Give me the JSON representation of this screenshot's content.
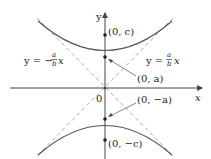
{
  "diagram": {
    "type": "hyperbola-vertical",
    "axes": {
      "x_label": "x",
      "y_label": "y",
      "origin_label": "0"
    },
    "asymptotes": {
      "negative": {
        "lhs": "y = −",
        "num": "a",
        "den": "b",
        "var": "x"
      },
      "positive": {
        "lhs": "y = ",
        "num": "a",
        "den": "b",
        "var": "x"
      }
    },
    "points": {
      "focus_top": "(0, c)",
      "vertex_top": "(0, a)",
      "vertex_bottom": "(0, −a)",
      "focus_bottom": "(0, −c)"
    },
    "colors": {
      "curve": "#555555",
      "axis": "#444444",
      "asymptote": "#aaaaaa",
      "text": "#222222"
    }
  }
}
